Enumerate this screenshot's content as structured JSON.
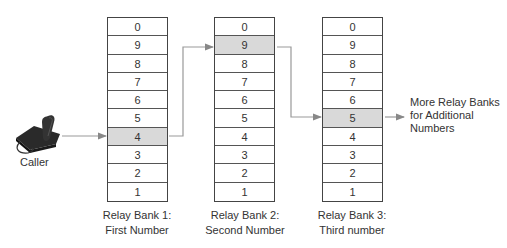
{
  "caller": {
    "label": "Caller",
    "icon": "telephone-icon"
  },
  "banks": [
    {
      "label_line1": "Relay Bank 1:",
      "label_line2": "First Number",
      "selected": "4",
      "cells": [
        "0",
        "9",
        "8",
        "7",
        "6",
        "5",
        "4",
        "3",
        "2",
        "1"
      ]
    },
    {
      "label_line1": "Relay Bank 2:",
      "label_line2": "Second Number",
      "selected": "9",
      "cells": [
        "0",
        "9",
        "8",
        "7",
        "6",
        "5",
        "4",
        "3",
        "2",
        "1"
      ]
    },
    {
      "label_line1": "Relay Bank 3:",
      "label_line2": "Third number",
      "selected": "5",
      "cells": [
        "0",
        "9",
        "8",
        "7",
        "6",
        "5",
        "4",
        "3",
        "2",
        "1"
      ]
    }
  ],
  "more": {
    "line1": "More Relay Banks",
    "line2": "for Additional",
    "line3": "Numbers"
  },
  "colors": {
    "highlight": "#d9d9d9",
    "border": "#444444",
    "arrow": "#888888"
  }
}
